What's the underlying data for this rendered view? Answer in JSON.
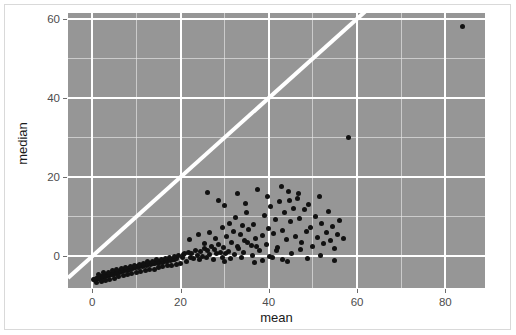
{
  "chart_data": {
    "type": "scatter",
    "title": "",
    "xlabel": "mean",
    "ylabel": "median",
    "xlim": [
      -5.5,
      89.0
    ],
    "ylim": [
      -8.0,
      61.5
    ],
    "xticks": [
      0,
      20,
      40,
      60,
      80
    ],
    "xtick_labels": [
      "0",
      "20",
      "40",
      "60",
      "80"
    ],
    "yticks": [
      0,
      20,
      40,
      60
    ],
    "ytick_labels": [
      "0",
      "20",
      "40",
      "60"
    ],
    "x_minor_ticks": [
      10,
      30,
      50,
      70
    ],
    "y_minor_ticks": [
      10,
      30,
      50
    ],
    "grid": true,
    "grid_color": "#ffffff",
    "panel_background": "#969696",
    "point_color": "#111111",
    "point_size": 5,
    "legend": null,
    "annotations": [
      {
        "type": "reference-line",
        "name": "identity-line",
        "description": "white diagonal y = x line",
        "slope": 1,
        "intercept": 0,
        "color": "#ffffff",
        "width": 4
      }
    ],
    "series": [
      {
        "name": "mean vs median",
        "marker": "circle",
        "color": "#111111",
        "points": [
          [
            0.2,
            -5.8
          ],
          [
            0.5,
            -5.9
          ],
          [
            0.7,
            -6.1
          ],
          [
            0.9,
            -5.7
          ],
          [
            1.1,
            -5.5
          ],
          [
            1.3,
            -5.6
          ],
          [
            1.5,
            -5.4
          ],
          [
            1.7,
            -5.3
          ],
          [
            1.9,
            -5.5
          ],
          [
            2.1,
            -5.2
          ],
          [
            2.3,
            -5.1
          ],
          [
            2.5,
            -5.3
          ],
          [
            2.7,
            -5.0
          ],
          [
            2.9,
            -4.9
          ],
          [
            3.1,
            -5.1
          ],
          [
            3.3,
            -4.8
          ],
          [
            3.5,
            -4.7
          ],
          [
            3.7,
            -4.9
          ],
          [
            3.9,
            -4.6
          ],
          [
            4.1,
            -4.5
          ],
          [
            4.3,
            -4.7
          ],
          [
            4.5,
            -4.4
          ],
          [
            4.7,
            -4.3
          ],
          [
            4.9,
            -4.5
          ],
          [
            5.1,
            -4.2
          ],
          [
            5.3,
            -4.1
          ],
          [
            5.5,
            -4.3
          ],
          [
            5.7,
            -4.0
          ],
          [
            5.9,
            -3.9
          ],
          [
            6.1,
            -4.1
          ],
          [
            6.3,
            -3.8
          ],
          [
            6.5,
            -3.7
          ],
          [
            6.7,
            -3.9
          ],
          [
            6.9,
            -3.6
          ],
          [
            7.1,
            -3.5
          ],
          [
            7.3,
            -3.7
          ],
          [
            7.5,
            -3.4
          ],
          [
            7.7,
            -3.3
          ],
          [
            7.9,
            -3.5
          ],
          [
            8.1,
            -3.2
          ],
          [
            8.3,
            -3.1
          ],
          [
            8.5,
            -3.3
          ],
          [
            8.7,
            -3.0
          ],
          [
            8.9,
            -2.9
          ],
          [
            9.1,
            -3.1
          ],
          [
            9.3,
            -2.8
          ],
          [
            9.5,
            -2.7
          ],
          [
            9.7,
            -2.9
          ],
          [
            9.9,
            -2.6
          ],
          [
            10.2,
            -2.5
          ],
          [
            10.5,
            -2.7
          ],
          [
            10.8,
            -2.4
          ],
          [
            11.1,
            -2.3
          ],
          [
            11.4,
            -2.5
          ],
          [
            11.7,
            -2.2
          ],
          [
            12.0,
            -2.1
          ],
          [
            12.3,
            -2.3
          ],
          [
            12.6,
            -2.0
          ],
          [
            12.9,
            -1.9
          ],
          [
            13.2,
            -2.1
          ],
          [
            13.5,
            -1.8
          ],
          [
            13.8,
            -1.7
          ],
          [
            14.1,
            -1.9
          ],
          [
            14.4,
            -1.6
          ],
          [
            14.7,
            -1.5
          ],
          [
            15.0,
            -1.7
          ],
          [
            15.3,
            -1.4
          ],
          [
            15.6,
            -1.3
          ],
          [
            15.9,
            -1.5
          ],
          [
            16.2,
            -1.2
          ],
          [
            16.5,
            -1.1
          ],
          [
            16.8,
            -1.3
          ],
          [
            17.1,
            -1.0
          ],
          [
            17.4,
            -0.9
          ],
          [
            17.7,
            -1.1
          ],
          [
            18.0,
            -0.8
          ],
          [
            18.3,
            -0.7
          ],
          [
            18.6,
            -0.9
          ],
          [
            18.9,
            -0.6
          ],
          [
            19.2,
            -0.5
          ],
          [
            1.0,
            -6.5
          ],
          [
            2.0,
            -6.3
          ],
          [
            3.0,
            -6.0
          ],
          [
            4.0,
            -5.8
          ],
          [
            5.0,
            -5.6
          ],
          [
            6.0,
            -5.2
          ],
          [
            7.0,
            -4.8
          ],
          [
            8.0,
            -4.6
          ],
          [
            9.0,
            -4.4
          ],
          [
            10.0,
            -4.2
          ],
          [
            11.0,
            -3.9
          ],
          [
            12.0,
            -3.6
          ],
          [
            13.0,
            -3.4
          ],
          [
            14.0,
            -3.2
          ],
          [
            15.0,
            -2.9
          ],
          [
            16.0,
            -2.6
          ],
          [
            17.0,
            -2.4
          ],
          [
            18.0,
            -2.2
          ],
          [
            19.0,
            -2.0
          ],
          [
            20.0,
            -1.8
          ],
          [
            1.5,
            -4.6
          ],
          [
            2.6,
            -4.2
          ],
          [
            3.6,
            -4.0
          ],
          [
            4.6,
            -3.6
          ],
          [
            5.6,
            -3.3
          ],
          [
            6.6,
            -3.0
          ],
          [
            7.6,
            -2.8
          ],
          [
            8.6,
            -2.5
          ],
          [
            9.6,
            -2.2
          ],
          [
            10.6,
            -2.0
          ],
          [
            11.6,
            -1.7
          ],
          [
            12.6,
            -1.4
          ],
          [
            13.6,
            -1.2
          ],
          [
            14.6,
            -0.9
          ],
          [
            15.6,
            -0.7
          ],
          [
            16.6,
            -0.5
          ],
          [
            17.6,
            -0.3
          ],
          [
            18.6,
            0.0
          ],
          [
            19.6,
            0.2
          ],
          [
            20.6,
            0.4
          ],
          [
            20.5,
            -0.4
          ],
          [
            21.0,
            0.6
          ],
          [
            21.4,
            -1.2
          ],
          [
            21.8,
            1.0
          ],
          [
            22.2,
            -0.2
          ],
          [
            22.6,
            0.8
          ],
          [
            23.0,
            -0.6
          ],
          [
            23.4,
            1.6
          ],
          [
            23.8,
            0.2
          ],
          [
            24.2,
            -0.9
          ],
          [
            24.6,
            1.2
          ],
          [
            25.0,
            0.0
          ],
          [
            25.4,
            2.0
          ],
          [
            25.8,
            -0.4
          ],
          [
            26.2,
            1.4
          ],
          [
            26.6,
            0.4
          ],
          [
            27.0,
            2.6
          ],
          [
            27.4,
            -0.8
          ],
          [
            27.8,
            1.8
          ],
          [
            28.2,
            0.6
          ],
          [
            28.6,
            3.0
          ],
          [
            29.0,
            1.0
          ],
          [
            29.4,
            -0.3
          ],
          [
            29.8,
            2.2
          ],
          [
            30.2,
            0.8
          ],
          [
            22.0,
            4.2
          ],
          [
            24.0,
            5.4
          ],
          [
            25.5,
            3.2
          ],
          [
            26.5,
            6.0
          ],
          [
            28.0,
            4.6
          ],
          [
            29.5,
            7.2
          ],
          [
            30.5,
            5.0
          ],
          [
            31.0,
            8.4
          ],
          [
            31.5,
            3.6
          ],
          [
            32.0,
            6.4
          ],
          [
            32.5,
            9.8
          ],
          [
            33.0,
            2.4
          ],
          [
            33.5,
            5.6
          ],
          [
            34.0,
            7.8
          ],
          [
            34.5,
            4.0
          ],
          [
            35.0,
            11.2
          ],
          [
            35.5,
            6.8
          ],
          [
            36.0,
            2.8
          ],
          [
            36.5,
            8.0
          ],
          [
            37.0,
            4.4
          ],
          [
            30.8,
            1.2
          ],
          [
            31.3,
            -0.6
          ],
          [
            32.2,
            0.4
          ],
          [
            33.2,
            2.0
          ],
          [
            34.2,
            1.0
          ],
          [
            35.2,
            3.4
          ],
          [
            36.2,
            0.2
          ],
          [
            37.2,
            2.6
          ],
          [
            38.0,
            1.6
          ],
          [
            38.6,
            5.2
          ],
          [
            39.0,
            10.4
          ],
          [
            39.5,
            3.0
          ],
          [
            40.0,
            7.0
          ],
          [
            40.5,
            12.6
          ],
          [
            41.0,
            5.8
          ],
          [
            41.5,
            9.2
          ],
          [
            42.0,
            2.2
          ],
          [
            42.5,
            13.8
          ],
          [
            43.0,
            6.6
          ],
          [
            43.5,
            11.0
          ],
          [
            44.0,
            4.2
          ],
          [
            44.5,
            16.4
          ],
          [
            45.0,
            8.8
          ],
          [
            45.5,
            12.0
          ],
          [
            46.0,
            5.0
          ],
          [
            46.5,
            14.6
          ],
          [
            47.0,
            9.6
          ],
          [
            47.5,
            3.6
          ],
          [
            48.0,
            11.8
          ],
          [
            48.5,
            6.2
          ],
          [
            38.5,
            -1.0
          ],
          [
            40.2,
            0.0
          ],
          [
            41.8,
            1.4
          ],
          [
            43.2,
            -0.8
          ],
          [
            45.2,
            0.6
          ],
          [
            47.2,
            1.8
          ],
          [
            49.0,
            13.2
          ],
          [
            49.5,
            7.4
          ],
          [
            50.0,
            2.4
          ],
          [
            50.5,
            10.0
          ],
          [
            51.0,
            4.8
          ],
          [
            51.5,
            15.2
          ],
          [
            52.0,
            8.2
          ],
          [
            52.5,
            3.2
          ],
          [
            53.0,
            6.0
          ],
          [
            53.5,
            11.4
          ],
          [
            54.0,
            4.0
          ],
          [
            54.5,
            7.6
          ],
          [
            55.0,
            2.0
          ],
          [
            55.5,
            5.4
          ],
          [
            26.0,
            16.2
          ],
          [
            28.5,
            14.0
          ],
          [
            30.0,
            12.8
          ],
          [
            32.8,
            15.8
          ],
          [
            34.8,
            13.4
          ],
          [
            37.5,
            17.0
          ],
          [
            39.8,
            15.0
          ],
          [
            42.8,
            17.6
          ],
          [
            44.8,
            14.2
          ],
          [
            46.8,
            16.0
          ],
          [
            30.0,
            -1.4
          ],
          [
            33.8,
            -0.2
          ],
          [
            36.8,
            -1.6
          ],
          [
            40.8,
            -0.4
          ],
          [
            44.2,
            -1.2
          ],
          [
            48.8,
            -0.6
          ],
          [
            51.8,
            0.2
          ],
          [
            54.8,
            -1.0
          ],
          [
            56.0,
            9.0
          ],
          [
            57.0,
            4.4
          ],
          [
            58.0,
            30.0
          ],
          [
            84.0,
            58.0
          ]
        ]
      }
    ]
  },
  "axes": {
    "y_title": "median",
    "x_title": "mean"
  }
}
